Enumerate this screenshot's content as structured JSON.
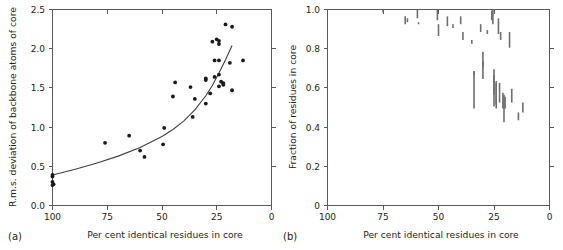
{
  "figure": {
    "type": "scientific-figure",
    "panel_count": 2
  },
  "panel_a": {
    "label": "(a)",
    "xlabel": "Per cent identical residues in core",
    "ylabel": "R.m.s. deviation of backbone atoms of core",
    "xticks": [
      "100",
      "75",
      "50",
      "25",
      "0"
    ],
    "yticks": [
      "0.0",
      "0.5",
      "1.0",
      "1.5",
      "2.0",
      "2.5"
    ]
  },
  "panel_b": {
    "label": "(b)",
    "xlabel": "Per cent identical residues in core",
    "ylabel": "Fraction of residues in core",
    "xticks": [
      "100",
      "75",
      "50",
      "25",
      "0"
    ],
    "yticks": [
      "0",
      "0.2",
      "0.4",
      "0.6",
      "0.8",
      "1.0"
    ]
  },
  "chart_data": [
    {
      "type": "scatter",
      "panel": "(a)",
      "title": "",
      "xlabel": "Per cent identical residues in core",
      "ylabel": "R.m.s. deviation of backbone atoms of core",
      "xlim": [
        100,
        0
      ],
      "ylim": [
        0.0,
        2.5
      ],
      "x_axis_reversed": true,
      "grid": false,
      "legend": "none",
      "xticks": [
        100,
        75,
        50,
        25,
        0
      ],
      "yticks": [
        0.0,
        0.5,
        1.0,
        1.5,
        2.0,
        2.5
      ],
      "points": [
        {
          "x": 100,
          "y": 0.39
        },
        {
          "x": 100,
          "y": 0.37
        },
        {
          "x": 100,
          "y": 0.3
        },
        {
          "x": 100,
          "y": 0.26
        },
        {
          "x": 99.5,
          "y": 0.27
        },
        {
          "x": 76,
          "y": 0.8
        },
        {
          "x": 65,
          "y": 0.89
        },
        {
          "x": 60,
          "y": 0.7
        },
        {
          "x": 58,
          "y": 0.62
        },
        {
          "x": 49,
          "y": 0.99
        },
        {
          "x": 49.5,
          "y": 0.78
        },
        {
          "x": 44,
          "y": 1.57
        },
        {
          "x": 45,
          "y": 1.39
        },
        {
          "x": 37,
          "y": 1.51
        },
        {
          "x": 36,
          "y": 1.13
        },
        {
          "x": 35,
          "y": 1.36
        },
        {
          "x": 30,
          "y": 1.62
        },
        {
          "x": 30,
          "y": 1.6
        },
        {
          "x": 30,
          "y": 1.3
        },
        {
          "x": 28,
          "y": 1.43
        },
        {
          "x": 27,
          "y": 2.09
        },
        {
          "x": 26,
          "y": 1.85
        },
        {
          "x": 26,
          "y": 1.64
        },
        {
          "x": 25,
          "y": 2.12
        },
        {
          "x": 24,
          "y": 2.1
        },
        {
          "x": 24,
          "y": 2.06
        },
        {
          "x": 24,
          "y": 1.85
        },
        {
          "x": 24,
          "y": 1.67
        },
        {
          "x": 24,
          "y": 1.52
        },
        {
          "x": 23,
          "y": 1.58
        },
        {
          "x": 22,
          "y": 1.56
        },
        {
          "x": 22,
          "y": 1.54
        },
        {
          "x": 21,
          "y": 2.31
        },
        {
          "x": 18,
          "y": 2.28
        },
        {
          "x": 19,
          "y": 1.82
        },
        {
          "x": 18,
          "y": 1.47
        },
        {
          "x": 13,
          "y": 1.85
        }
      ],
      "fit_curve": {
        "description": "smooth increasing curve fitted through the data",
        "points": [
          {
            "x": 100,
            "y": 0.39
          },
          {
            "x": 90,
            "y": 0.46
          },
          {
            "x": 80,
            "y": 0.54
          },
          {
            "x": 70,
            "y": 0.63
          },
          {
            "x": 60,
            "y": 0.74
          },
          {
            "x": 50,
            "y": 0.88
          },
          {
            "x": 45,
            "y": 0.97
          },
          {
            "x": 40,
            "y": 1.08
          },
          {
            "x": 35,
            "y": 1.22
          },
          {
            "x": 30,
            "y": 1.4
          },
          {
            "x": 27,
            "y": 1.53
          },
          {
            "x": 24,
            "y": 1.69
          },
          {
            "x": 21,
            "y": 1.86
          },
          {
            "x": 18,
            "y": 2.04
          }
        ]
      }
    },
    {
      "type": "range-bar",
      "panel": "(b)",
      "title": "",
      "xlabel": "Per cent identical residues in core",
      "ylabel": "Fraction of residues in core",
      "xlim": [
        100,
        0
      ],
      "ylim": [
        0.0,
        1.0
      ],
      "x_axis_reversed": true,
      "grid": false,
      "legend": "none",
      "xticks": [
        100,
        75,
        50,
        25,
        0
      ],
      "yticks": [
        0,
        0.2,
        0.4,
        0.6,
        0.8,
        1.0
      ],
      "bars": [
        {
          "x": 75,
          "ymin": 0.985,
          "ymax": 1.0
        },
        {
          "x": 65,
          "ymin": 0.925,
          "ymax": 0.965
        },
        {
          "x": 64,
          "ymin": 0.935,
          "ymax": 0.955
        },
        {
          "x": 59.5,
          "ymin": 0.955,
          "ymax": 1.0
        },
        {
          "x": 59,
          "ymin": 0.925,
          "ymax": 0.935
        },
        {
          "x": 50.5,
          "ymin": 0.945,
          "ymax": 1.0
        },
        {
          "x": 50,
          "ymin": 0.865,
          "ymax": 0.925
        },
        {
          "x": 46,
          "ymin": 0.915,
          "ymax": 0.965
        },
        {
          "x": 43.5,
          "ymin": 0.905,
          "ymax": 0.925
        },
        {
          "x": 40,
          "ymin": 0.925,
          "ymax": 0.965
        },
        {
          "x": 39,
          "ymin": 0.845,
          "ymax": 0.885
        },
        {
          "x": 35,
          "ymin": 0.825,
          "ymax": 0.845
        },
        {
          "x": 34,
          "ymin": 0.665,
          "ymax": 0.685
        },
        {
          "x": 34,
          "ymin": 0.495,
          "ymax": 0.685
        },
        {
          "x": 31,
          "ymin": 0.885,
          "ymax": 0.925
        },
        {
          "x": 30,
          "ymin": 0.705,
          "ymax": 0.785
        },
        {
          "x": 30,
          "ymin": 0.645,
          "ymax": 0.735
        },
        {
          "x": 28,
          "ymin": 0.875,
          "ymax": 0.895
        },
        {
          "x": 26,
          "ymin": 0.945,
          "ymax": 0.995
        },
        {
          "x": 25.5,
          "ymin": 0.925,
          "ymax": 1.0
        },
        {
          "x": 25,
          "ymin": 0.565,
          "ymax": 0.695
        },
        {
          "x": 25,
          "ymin": 0.505,
          "ymax": 0.665
        },
        {
          "x": 24,
          "ymin": 0.495,
          "ymax": 0.635
        },
        {
          "x": 24,
          "ymin": 0.515,
          "ymax": 0.625
        },
        {
          "x": 23,
          "ymin": 0.875,
          "ymax": 0.955
        },
        {
          "x": 22.5,
          "ymin": 0.525,
          "ymax": 0.625
        },
        {
          "x": 22,
          "ymin": 0.845,
          "ymax": 0.885
        },
        {
          "x": 21,
          "ymin": 0.495,
          "ymax": 0.575
        },
        {
          "x": 20.5,
          "ymin": 0.425,
          "ymax": 0.565
        },
        {
          "x": 20,
          "ymin": 0.495,
          "ymax": 0.555
        },
        {
          "x": 18,
          "ymin": 0.805,
          "ymax": 0.885
        },
        {
          "x": 17,
          "ymin": 0.525,
          "ymax": 0.595
        },
        {
          "x": 14,
          "ymin": 0.435,
          "ymax": 0.475
        },
        {
          "x": 12,
          "ymin": 0.475,
          "ymax": 0.525
        }
      ]
    }
  ]
}
